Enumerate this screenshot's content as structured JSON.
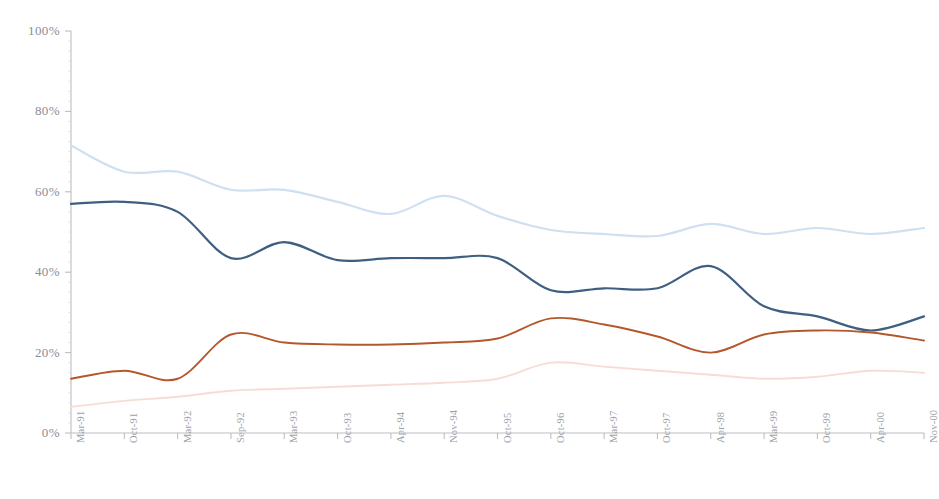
{
  "chart_data": {
    "type": "line",
    "title": "",
    "xlabel": "",
    "ylabel": "",
    "ylim": [
      0,
      100
    ],
    "ytick_labels": [
      "0%",
      "20%",
      "40%",
      "60%",
      "80%",
      "100%"
    ],
    "ytick_values": [
      0,
      20,
      40,
      60,
      80,
      100
    ],
    "grid": false,
    "legend": "none",
    "categories": [
      "Mar-91",
      "Oct-91",
      "Mar-92",
      "Sep-92",
      "Mar-93",
      "Oct-93",
      "Apr-94",
      "Nov-94",
      "Oct-95",
      "Oct-96",
      "Mar-97",
      "Oct-97",
      "Apr-98",
      "Mar-99",
      "Oct-99",
      "Apr-00",
      "Nov-00"
    ],
    "series": [
      {
        "name": "series-light-blue",
        "color": "#cfe0f0",
        "values": [
          71.5,
          65.0,
          65.0,
          60.5,
          60.5,
          57.5,
          54.5,
          59.0,
          54.0,
          50.5,
          49.5,
          49.0,
          52.0,
          49.5,
          51.0,
          49.5,
          51.0
        ]
      },
      {
        "name": "series-dark-blue",
        "color": "#3f5f82",
        "values": [
          57.0,
          57.5,
          55.0,
          43.5,
          47.5,
          43.0,
          43.5,
          43.5,
          43.5,
          35.5,
          36.0,
          36.0,
          41.5,
          31.5,
          29.0,
          25.5,
          29.0
        ]
      },
      {
        "name": "series-dark-orange",
        "color": "#b5572c",
        "values": [
          13.5,
          15.5,
          13.5,
          24.5,
          22.5,
          22.0,
          22.0,
          22.5,
          23.5,
          28.5,
          27.0,
          24.0,
          20.0,
          24.5,
          25.5,
          25.0,
          23.0
        ]
      },
      {
        "name": "series-light-pink",
        "color": "#f7dcd6",
        "values": [
          6.5,
          8.0,
          9.0,
          10.5,
          11.0,
          11.5,
          12.0,
          12.5,
          13.5,
          17.5,
          16.5,
          15.5,
          14.5,
          13.5,
          14.0,
          15.5,
          15.0
        ]
      }
    ]
  },
  "axis": {
    "tick_color": "#bdbdc4",
    "label_color": "#8c8c94"
  }
}
